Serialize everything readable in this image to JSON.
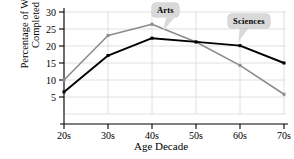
{
  "chart_data": {
    "type": "line",
    "title": "",
    "xlabel": "Age Decade",
    "ylabel": "Percentage of Works Completed",
    "ylabel_line1": "Percentage of Works",
    "ylabel_line2": "Completed",
    "categories": [
      "20s",
      "30s",
      "40s",
      "50s",
      "60s",
      "70s"
    ],
    "yticks": [
      5,
      10,
      15,
      20,
      25,
      30
    ],
    "ylim": [
      0,
      30
    ],
    "grid": true,
    "legend_position": "annotations",
    "series": [
      {
        "name": "Arts",
        "color": "#8c8c8c",
        "values": [
          10.0,
          23.1,
          26.4,
          21.2,
          14.3,
          5.8
        ]
      },
      {
        "name": "Sciences",
        "color": "#000000",
        "values": [
          6.5,
          17.2,
          22.3,
          21.2,
          20.1,
          15.0
        ]
      }
    ],
    "annotations": [
      {
        "label": "Arts",
        "target_category": "40s"
      },
      {
        "label": "Sciences",
        "target_category": "60s"
      }
    ]
  },
  "axis": {
    "ytick_labels": [
      "5",
      "10",
      "15",
      "20",
      "25",
      "30"
    ],
    "xtick_labels": [
      "20s",
      "30s",
      "40s",
      "50s",
      "60s",
      "70s"
    ]
  },
  "colors": {
    "arts": "#8c8c8c",
    "sciences": "#000000",
    "grid": "#d8d8d8",
    "axis": "#000000",
    "callout_bg": "#d9d9d9",
    "background": "#ffffff"
  }
}
